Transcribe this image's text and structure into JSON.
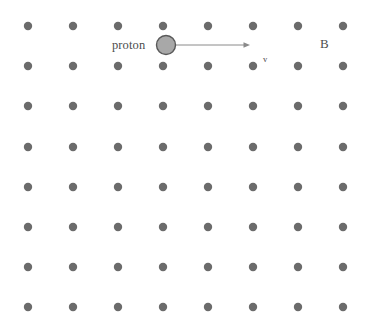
{
  "figure": {
    "type": "physics-diagram",
    "width": 368,
    "height": 328,
    "background_color": "#ffffff"
  },
  "field": {
    "symbol_name": "field-out-of-page-dot",
    "dot_color": "#6b6b6b",
    "dot_radius": 4.2,
    "columns": 8,
    "rows": 8,
    "x_positions": [
      28,
      73,
      118,
      163,
      208,
      253,
      298,
      343
    ],
    "y_positions": [
      26,
      66,
      106,
      147,
      187,
      227,
      267,
      307
    ],
    "label": "B",
    "label_x": 320,
    "label_y": 37
  },
  "particle": {
    "label": "proton",
    "label_x": 112,
    "label_y": 39,
    "circle_cx": 166,
    "circle_cy": 45,
    "circle_r": 9.5,
    "fill_color": "#a8a8a8",
    "stroke_color": "#595959"
  },
  "velocity": {
    "label": "v",
    "label_x": 263,
    "label_y": 55,
    "arrow_color": "#8a8a8a",
    "arrow_x1": 176,
    "arrow_y1": 45,
    "arrow_x2": 250,
    "arrow_y2": 45
  }
}
